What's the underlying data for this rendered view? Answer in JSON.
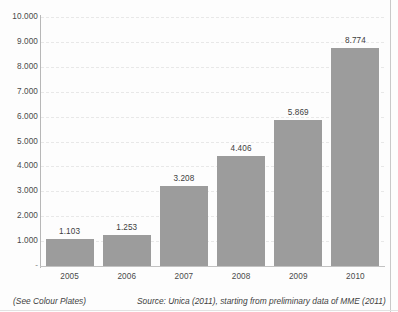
{
  "chart_data": {
    "type": "bar",
    "title": "",
    "xlabel": "",
    "ylabel": "",
    "categories": [
      "2005",
      "2006",
      "2007",
      "2008",
      "2009",
      "2010"
    ],
    "values": [
      1103,
      1253,
      3208,
      4406,
      5869,
      8774
    ],
    "value_labels": [
      "1.103",
      "1.253",
      "3.208",
      "4.406",
      "5.869",
      "8.774"
    ],
    "ylim": [
      0,
      10000
    ],
    "ytick_values": [
      0,
      1000,
      2000,
      3000,
      4000,
      5000,
      6000,
      7000,
      8000,
      9000,
      10000
    ],
    "ytick_labels": [
      "-",
      "1.000",
      "2.000",
      "3.000",
      "4.000",
      "5.000",
      "6.000",
      "7.000",
      "8.000",
      "9.000",
      "10.000"
    ],
    "grid": true,
    "grid_axis": "y",
    "legend": false,
    "bar_color": "#9c9c9c",
    "series": [
      {
        "name": "",
        "values": [
          1103,
          1253,
          3208,
          4406,
          5869,
          8774
        ]
      }
    ]
  },
  "footer": {
    "left_note": "(See Colour Plates)",
    "source_note": "Source: Unica (2011), starting from preliminary data of MME (2011)"
  },
  "colors": {
    "bar": "#9c9c9c",
    "grid": "#e8e8e8",
    "axis": "#b7b7b7",
    "text": "#3a3a3a"
  }
}
